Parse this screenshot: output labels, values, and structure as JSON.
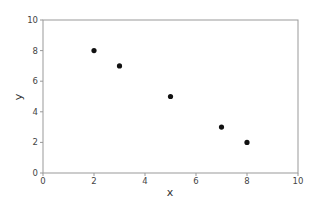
{
  "chart_data": {
    "type": "scatter",
    "title": "",
    "xlabel": "x",
    "ylabel": "y",
    "xlim": [
      0,
      10
    ],
    "ylim": [
      0,
      10
    ],
    "grid": false,
    "x_ticks": [
      "0",
      "2",
      "4",
      "6",
      "8",
      "10"
    ],
    "y_ticks": [
      "0",
      "2",
      "4",
      "6",
      "8",
      "10"
    ],
    "series": [
      {
        "name": "",
        "x": [
          2,
          3,
          5,
          7,
          8
        ],
        "y": [
          8,
          7,
          5,
          3,
          2
        ],
        "color": "#111111"
      }
    ]
  }
}
